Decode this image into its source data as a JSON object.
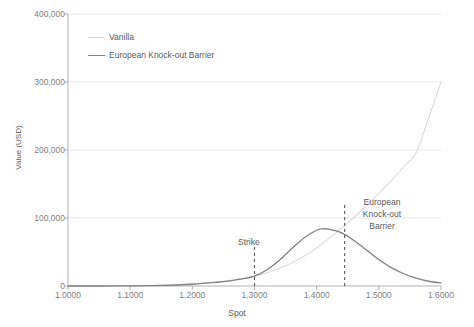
{
  "chart_data": {
    "type": "line",
    "title": "",
    "xlabel": "Spot",
    "ylabel": "Value (USD)",
    "xlim": [
      1.0,
      1.6
    ],
    "ylim": [
      0,
      400000
    ],
    "grid": true,
    "legend_position": "top-left-inside",
    "x_tick_labels": [
      "1.0000",
      "1.1000",
      "1.2000",
      "1.3000",
      "1.4000",
      "1.5000",
      "1.6000"
    ],
    "x_tick_values": [
      1.0,
      1.1,
      1.2,
      1.3,
      1.4,
      1.5,
      1.6
    ],
    "y_tick_labels": [
      "0",
      "100,000",
      "200,000",
      "300,000",
      "400,000"
    ],
    "y_tick_values": [
      0,
      100000,
      200000,
      300000,
      400000
    ],
    "series": [
      {
        "name": "Vanilla",
        "color": "#d9d9d9",
        "x": [
          1.0,
          1.05,
          1.1,
          1.15,
          1.2,
          1.25,
          1.28,
          1.3,
          1.32,
          1.34,
          1.36,
          1.38,
          1.4,
          1.42,
          1.44,
          1.46,
          1.48,
          1.5,
          1.52,
          1.54,
          1.56,
          1.58,
          1.6
        ],
        "values": [
          0,
          0,
          200,
          800,
          2600,
          7000,
          11000,
          14500,
          19500,
          26000,
          34000,
          44000,
          56000,
          70000,
          85000,
          101000,
          118000,
          136000,
          155000,
          175000,
          196000,
          247000,
          300000
        ]
      },
      {
        "name": "European Knock-out Barrier",
        "color": "#808080",
        "x": [
          1.0,
          1.05,
          1.1,
          1.15,
          1.2,
          1.24,
          1.26,
          1.28,
          1.3,
          1.32,
          1.34,
          1.36,
          1.38,
          1.4,
          1.41,
          1.42,
          1.44,
          1.46,
          1.48,
          1.5,
          1.52,
          1.54,
          1.56,
          1.58,
          1.6
        ],
        "values": [
          0,
          0,
          200,
          800,
          2600,
          5500,
          7500,
          10500,
          14500,
          24000,
          38000,
          55000,
          71000,
          82000,
          84000,
          83500,
          78000,
          67000,
          53000,
          39000,
          27000,
          18000,
          11500,
          7000,
          4500
        ]
      }
    ],
    "annotations": [
      {
        "label": "Strike",
        "x": 1.3,
        "line_top_value": 62000,
        "style": "dashed"
      },
      {
        "label": "European\nKnock-out\nBarrier",
        "x": 1.445,
        "line_top_value": 120000,
        "style": "dashed"
      }
    ],
    "annotation_labels": {
      "strike": "Strike",
      "barrier_line1": "European",
      "barrier_line2": "Knock-out",
      "barrier_line3": "Barrier"
    },
    "colors": {
      "vanilla": "#d9d9d9",
      "barrier": "#808080",
      "grid": "#e8e8e8",
      "axis": "#b0b0b0",
      "text": "#595959",
      "tick_text": "#7f7f7f"
    }
  }
}
